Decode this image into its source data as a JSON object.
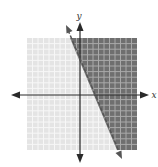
{
  "title": "",
  "axes": {
    "x_label": "x",
    "y_label": "y"
  },
  "colors": {
    "background": "#ffffff",
    "light_region": "#e4e4e4",
    "dark_region": "#6f6f6f",
    "grid_line_light": "#f7f7f7",
    "grid_line_dark": "#a9a9a9",
    "axis": "#2a2a2a",
    "boundary": "#555555"
  },
  "chart_data": {
    "type": "inequality-region",
    "title": "",
    "xlabel": "x",
    "ylabel": "y",
    "tick_labels": "none shown",
    "grid": true,
    "grid_cells_visible": 20,
    "axis_arrows": [
      "left",
      "right",
      "up",
      "down"
    ],
    "boundary_style": "dashed",
    "shaded_side": "right of / above the boundary line (darker region)",
    "unshaded_side": "left of / below the boundary line (lighter region)",
    "estimated_equation_note": "Not labeled in the image; estimated from pixel distances and grid cell size, assuming 1 grid cell = 1 unit.",
    "estimated_inequality": "2x + y > 6",
    "estimated_boundary_line": "y = -2x + 6",
    "estimated_slope": -2,
    "estimated_y_intercept": [
      0,
      6
    ],
    "estimated_x_intercept": [
      3,
      0
    ],
    "estimated_window": {
      "xlim": [
        -10,
        10
      ],
      "ylim": [
        -10,
        10
      ]
    }
  }
}
